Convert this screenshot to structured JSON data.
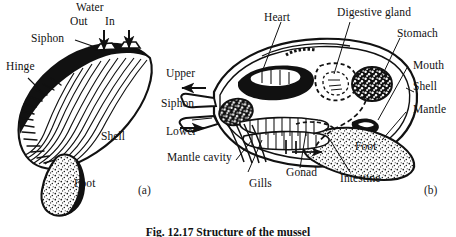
{
  "figure": {
    "caption": "Fig. 12.17   Structure of the mussel",
    "panels": [
      {
        "id": "a",
        "tag": "(a)",
        "title": "External view of the shell"
      },
      {
        "id": "b",
        "tag": "(b)",
        "title": "Internal anatomy, sagittal section"
      }
    ]
  },
  "panel_a": {
    "labels": {
      "water": "Water",
      "out": "Out",
      "in": "In",
      "siphon": "Siphon",
      "hinge": "Hinge",
      "shell": "Shell",
      "foot": "Foot"
    },
    "arrows": [
      {
        "name": "water-out-arrow",
        "direction": "up"
      },
      {
        "name": "water-in-arrow",
        "direction": "down"
      }
    ]
  },
  "panel_b": {
    "labels": {
      "heart": "Heart",
      "digestive_gland": "Digestive gland",
      "stomach": "Stomach",
      "mouth": "Mouth",
      "shell": "Shell",
      "mantle": "Mantle",
      "foot": "Foot",
      "intestine": "Intestine",
      "gonad": "Gonad",
      "gills": "Gills",
      "mantle_cavity": "Mantle cavity",
      "upper": "Upper",
      "siphon": "Siphon",
      "lower": "Lower"
    },
    "arrows": [
      {
        "name": "upper-siphon-outflow-arrow",
        "direction": "left"
      },
      {
        "name": "lower-siphon-inflow-arrow",
        "direction": "right"
      },
      {
        "name": "internal-current-arrow",
        "direction": "right"
      }
    ]
  },
  "colors": {
    "ink": "#111111",
    "paper": "#ffffff",
    "fill_dark": "#111111",
    "stipple": "#222222"
  }
}
